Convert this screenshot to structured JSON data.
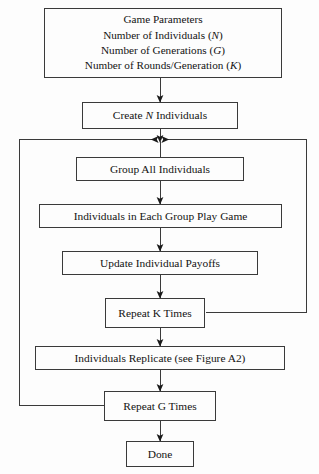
{
  "figure": {
    "colors": {
      "background": "#fdfdfd",
      "stroke": "#3a3a3a",
      "text": "#131313"
    }
  },
  "nodes": {
    "parameters": {
      "line1": "Game Parameters",
      "line2_text": "Number of Individuals (",
      "line2_var": "N",
      "line2_close": ")",
      "line3_text": "Number of Generations (",
      "line3_var": "G",
      "line3_close": ")",
      "line4_text": "Number of Rounds/Generation (",
      "line4_var": "K",
      "line4_close": ")"
    },
    "create": {
      "pre": "Create ",
      "var": "N",
      "post": " Individuals"
    },
    "group": {
      "label": "Group All Individuals"
    },
    "play": {
      "label": "Individuals in Each Group Play Game"
    },
    "payoffs": {
      "label": "Update Individual Payoffs"
    },
    "repeat_k": {
      "label": "Repeat K Times"
    },
    "replicate": {
      "label": "Individuals Replicate (see Figure A2)"
    },
    "repeat_g": {
      "label": "Repeat G Times"
    },
    "done": {
      "label": "Done"
    }
  },
  "edges": [
    {
      "name": "parameters-to-create",
      "kind": "arrow-down"
    },
    {
      "name": "create-to-junction",
      "kind": "arrow-down"
    },
    {
      "name": "junction-to-group",
      "kind": "line-down"
    },
    {
      "name": "group-to-play",
      "kind": "arrow-down"
    },
    {
      "name": "play-to-payoffs",
      "kind": "arrow-down"
    },
    {
      "name": "payoffs-to-repeat-k",
      "kind": "arrow-down"
    },
    {
      "name": "repeat-k-to-replicate",
      "kind": "arrow-down"
    },
    {
      "name": "replicate-to-repeat-g",
      "kind": "arrow-down"
    },
    {
      "name": "repeat-g-to-done",
      "kind": "arrow-down"
    },
    {
      "name": "k-loop-feedback",
      "kind": "loop-right-to-junction"
    },
    {
      "name": "g-loop-feedback",
      "kind": "loop-left-to-junction"
    }
  ]
}
